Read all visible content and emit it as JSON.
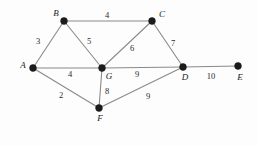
{
  "figure": {
    "type": "weighted-undirected-graph",
    "background_color": "#fdfdfd",
    "edge_color": "#8a8a8a",
    "vertex_color": "#1b1b1b",
    "label_color": "#1b1b1b",
    "width": 257,
    "height": 145
  },
  "chart_data": {
    "type": "diagram",
    "title": "",
    "graph_kind": "weighted undirected graph",
    "nodes": [
      {
        "id": "A",
        "label": "A",
        "x": 33,
        "y": 68,
        "label_x": 23,
        "label_y": 65
      },
      {
        "id": "B",
        "label": "B",
        "x": 64,
        "y": 21,
        "label_x": 56,
        "label_y": 13
      },
      {
        "id": "C",
        "label": "C",
        "x": 152,
        "y": 21,
        "label_x": 162,
        "label_y": 14
      },
      {
        "id": "D",
        "label": "D",
        "x": 183,
        "y": 67,
        "label_x": 185,
        "label_y": 77
      },
      {
        "id": "E",
        "label": "E",
        "x": 238,
        "y": 66,
        "label_x": 240,
        "label_y": 77
      },
      {
        "id": "F",
        "label": "F",
        "x": 99,
        "y": 108,
        "label_x": 100,
        "label_y": 118
      },
      {
        "id": "G",
        "label": "G",
        "x": 102,
        "y": 68,
        "label_x": 109,
        "label_y": 76
      }
    ],
    "edges": [
      {
        "from": "A",
        "to": "B",
        "weight": 3,
        "label": "3",
        "label_x": 38,
        "label_y": 41
      },
      {
        "from": "B",
        "to": "C",
        "weight": 4,
        "label": "4",
        "label_x": 107,
        "label_y": 15
      },
      {
        "from": "B",
        "to": "G",
        "weight": 5,
        "label": "5",
        "label_x": 89,
        "label_y": 41
      },
      {
        "from": "C",
        "to": "G",
        "weight": 6,
        "label": "6",
        "label_x": 132,
        "label_y": 48
      },
      {
        "from": "C",
        "to": "D",
        "weight": 7,
        "label": "7",
        "label_x": 173,
        "label_y": 43
      },
      {
        "from": "A",
        "to": "G",
        "weight": 4,
        "label": "4",
        "label_x": 70,
        "label_y": 74
      },
      {
        "from": "G",
        "to": "D",
        "weight": 9,
        "label": "9",
        "label_x": 137,
        "label_y": 74
      },
      {
        "from": "D",
        "to": "E",
        "weight": 10,
        "label": "10",
        "label_x": 211,
        "label_y": 76
      },
      {
        "from": "A",
        "to": "F",
        "weight": 2,
        "label": "2",
        "label_x": 61,
        "label_y": 95
      },
      {
        "from": "G",
        "to": "F",
        "weight": 8,
        "label": "8",
        "label_x": 107,
        "label_y": 91
      },
      {
        "from": "F",
        "to": "D",
        "weight": 9,
        "label": "9",
        "label_x": 148,
        "label_y": 96
      }
    ],
    "node_radius": 3.4
  }
}
